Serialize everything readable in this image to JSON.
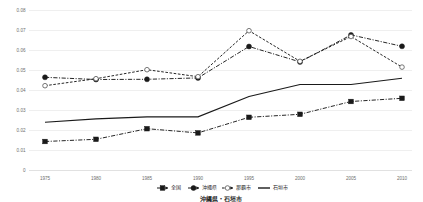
{
  "chart_data": {
    "type": "line",
    "title": "",
    "xlabel": "",
    "ylabel": "",
    "x": [
      1975,
      1980,
      1985,
      1990,
      1995,
      2000,
      2005,
      2010
    ],
    "xtick_labels": [
      "1975",
      "1980",
      "1985",
      "1990",
      "1995",
      "2000",
      "2005",
      "2010"
    ],
    "ytick_labels": [
      "0.08",
      "0.07",
      "0.06",
      "0.05",
      "0.04",
      "0.03",
      "0.02",
      "0.01",
      "0"
    ],
    "ytick_values": [
      0.08,
      0.07,
      0.06,
      0.05,
      0.04,
      0.03,
      0.02,
      0.01,
      0
    ],
    "ylim": [
      0,
      0.08
    ],
    "grid": true,
    "legend_position": "bottom",
    "series": [
      {
        "name": "全国",
        "marker": "square-filled",
        "line_style": "dash-dot",
        "color": "#1a1a1a",
        "values": [
          0.0145,
          0.0156,
          0.0209,
          0.0188,
          0.0266,
          0.0281,
          0.0345,
          0.0361
        ]
      },
      {
        "name": "沖縄県",
        "marker": "circle-filled",
        "line_style": "dash-dot",
        "color": "#1a1a1a",
        "values": [
          0.0466,
          0.0455,
          0.0456,
          0.0463,
          0.062,
          0.0543,
          0.0678,
          0.0621
        ]
      },
      {
        "name": "那覇市",
        "marker": "circle-open",
        "line_style": "dashed",
        "color": "#1a1a1a",
        "values": [
          0.0424,
          0.0459,
          0.0504,
          0.0469,
          0.0699,
          0.0546,
          0.067,
          0.0517
        ]
      },
      {
        "name": "石垣市",
        "marker": "none",
        "line_style": "solid",
        "color": "#1a1a1a",
        "values": [
          0.0241,
          0.0258,
          0.0268,
          0.0268,
          0.037,
          0.043,
          0.043,
          0.0461
        ]
      }
    ]
  },
  "legend": {
    "items": [
      {
        "label": "全国"
      },
      {
        "label": "沖縄県"
      },
      {
        "label": "那覇市"
      },
      {
        "label": "石垣市"
      }
    ]
  },
  "caption": {
    "text": "沖縄県・石垣市"
  }
}
